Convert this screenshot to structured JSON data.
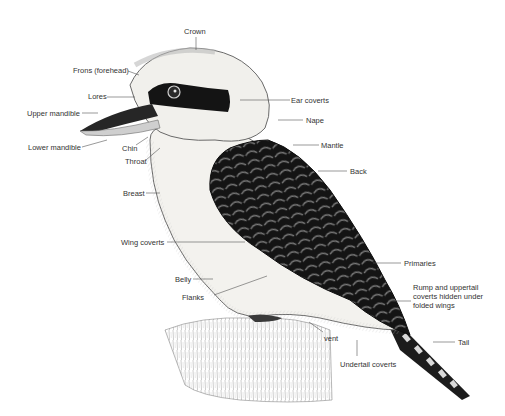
{
  "diagram": {
    "labels": [
      {
        "id": "crown",
        "text": "Crown",
        "x": 184,
        "y": 27
      },
      {
        "id": "frons",
        "text": "Frons (forehead)",
        "x": 73,
        "y": 66
      },
      {
        "id": "lores",
        "text": "Lores",
        "x": 88,
        "y": 92
      },
      {
        "id": "upper-mandible",
        "text": "Upper mandible",
        "x": 27,
        "y": 109
      },
      {
        "id": "lower-mandible",
        "text": "Lower mandible",
        "x": 28,
        "y": 143
      },
      {
        "id": "chin",
        "text": "Chin",
        "x": 122,
        "y": 144
      },
      {
        "id": "throat",
        "text": "Throat",
        "x": 125,
        "y": 157
      },
      {
        "id": "breast",
        "text": "Breast",
        "x": 123,
        "y": 189
      },
      {
        "id": "wing-coverts",
        "text": "Wing coverts",
        "x": 121,
        "y": 238
      },
      {
        "id": "belly",
        "text": "Belly",
        "x": 175,
        "y": 275
      },
      {
        "id": "flanks",
        "text": "Flanks",
        "x": 182,
        "y": 293
      },
      {
        "id": "ear-coverts",
        "text": "Ear coverts",
        "x": 291,
        "y": 96
      },
      {
        "id": "nape",
        "text": "Nape",
        "x": 306,
        "y": 116
      },
      {
        "id": "mantle",
        "text": "Mantle",
        "x": 321,
        "y": 141
      },
      {
        "id": "back",
        "text": "Back",
        "x": 350,
        "y": 167
      },
      {
        "id": "primaries",
        "text": "Primaries",
        "x": 404,
        "y": 260
      },
      {
        "id": "rump",
        "text": "Rump and uppertail coverts hidden under folded wings",
        "x": 413,
        "y": 283
      },
      {
        "id": "tail",
        "text": "Tail",
        "x": 458,
        "y": 338
      },
      {
        "id": "vent",
        "text": "vent",
        "x": 324,
        "y": 334
      },
      {
        "id": "undertail-coverts",
        "text": "Undertail coverts",
        "x": 340,
        "y": 360
      }
    ]
  },
  "colors": {
    "label_text": "#333333",
    "leader_line": "#555555",
    "plumage_dark": "#1a1a1a",
    "plumage_light": "#f0efeb",
    "eye_stripe": "#151515",
    "background": "#ffffff"
  }
}
